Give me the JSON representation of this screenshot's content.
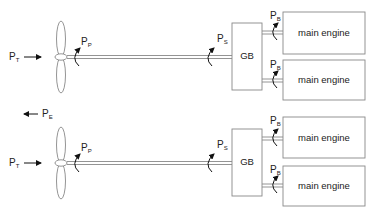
{
  "diagram": {
    "type": "twin-shaft propulsion arrangement",
    "colors": {
      "line": "#888888",
      "text": "#222222",
      "arrow": "#111111"
    },
    "symbols": {
      "thrust_power": {
        "main": "P",
        "sub": "T"
      },
      "effective_power": {
        "main": "P",
        "sub": "E"
      },
      "propeller_power": {
        "main": "P",
        "sub": "P"
      },
      "shaft_power": {
        "main": "P",
        "sub": "S"
      },
      "brake_power": {
        "main": "P",
        "sub": "B"
      }
    },
    "shafts": [
      {
        "gearbox_label": "GB",
        "engines": [
          {
            "label": "main engine"
          },
          {
            "label": "main engine"
          }
        ]
      },
      {
        "gearbox_label": "GB",
        "engines": [
          {
            "label": "main engine"
          },
          {
            "label": "main engine"
          }
        ]
      }
    ]
  }
}
